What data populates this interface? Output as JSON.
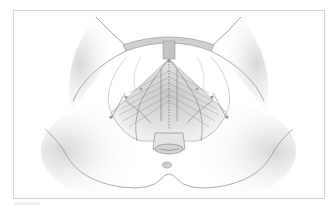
{
  "figure": {
    "type": "anatomical-illustration",
    "palette": {
      "background": "#ffffff",
      "frame_border": "#d4d4d4",
      "skin_shade": "#d9d9d9",
      "outline": "#8a8a8a",
      "muscle": "#b5b5b5",
      "nerve": "#7a7a7a"
    },
    "caption": ""
  }
}
